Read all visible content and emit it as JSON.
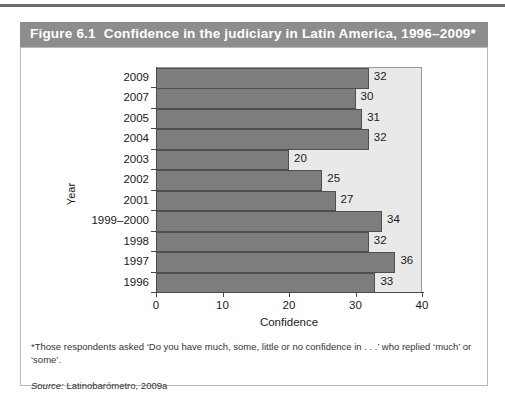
{
  "figure": {
    "number": "Figure 6.1",
    "caption": "Confidence in the judiciary in Latin America, 1996–2009*",
    "footnote": "*Those respondents asked ‘Do you have much, some, little or no confidence in . . .’ who replied ‘much’ or ‘some’.",
    "source_label": "Source:",
    "source_value": "Latinobarómetro, 2009a"
  },
  "colors": {
    "title_bar": "#8d8d8d",
    "title_text": "#ffffff",
    "plot_background": "#e9e9e9",
    "bar_fill": "#7d7d7d",
    "bar_border": "#4f4f4f",
    "axis": "#4a4a4a",
    "card_border": "#b9b9b9"
  },
  "chart_data": {
    "type": "bar",
    "orientation": "horizontal",
    "title": "Confidence in the judiciary in Latin America, 1996–2009*",
    "xlabel": "Confidence",
    "ylabel": "Year",
    "xlim": [
      0,
      40
    ],
    "xticks": [
      0,
      10,
      20,
      30,
      40
    ],
    "xtick_labels": [
      "0",
      "10",
      "20",
      "30",
      "40"
    ],
    "grid": false,
    "legend": false,
    "data_labels": true,
    "categories": [
      "2009",
      "2007",
      "2005",
      "2004",
      "2003",
      "2002",
      "2001",
      "1999–2000",
      "1998",
      "1997",
      "1996"
    ],
    "values": [
      32,
      30,
      31,
      32,
      20,
      25,
      27,
      34,
      32,
      36,
      33
    ],
    "bars": [
      {
        "category": "2009",
        "value": 32,
        "label": "32"
      },
      {
        "category": "2007",
        "value": 30,
        "label": "30"
      },
      {
        "category": "2005",
        "value": 31,
        "label": "31"
      },
      {
        "category": "2004",
        "value": 32,
        "label": "32"
      },
      {
        "category": "2003",
        "value": 20,
        "label": "20"
      },
      {
        "category": "2002",
        "value": 25,
        "label": "25"
      },
      {
        "category": "2001",
        "value": 27,
        "label": "27"
      },
      {
        "category": "1999–2000",
        "value": 34,
        "label": "34"
      },
      {
        "category": "1998",
        "value": 32,
        "label": "32"
      },
      {
        "category": "1997",
        "value": 36,
        "label": "36"
      },
      {
        "category": "1996",
        "value": 33,
        "label": "33"
      }
    ]
  }
}
